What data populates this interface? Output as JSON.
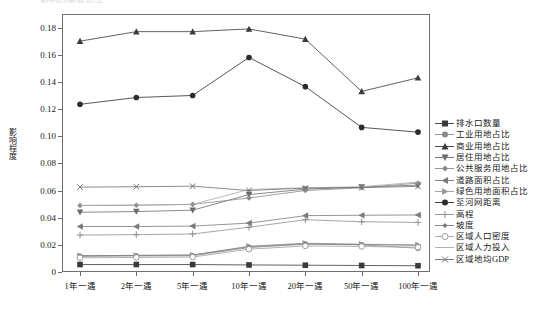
{
  "figure": {
    "partial_header_text": "影响因素敏感性",
    "y_axis_title": "影响程度"
  },
  "chart_data": {
    "type": "line",
    "title": "",
    "xlabel": "",
    "ylabel": "影响程度",
    "categories": [
      "1年一遇",
      "2年一遇",
      "5年一遇",
      "10年一遇",
      "20年一遇",
      "50年一遇",
      "100年一遇"
    ],
    "ylim": [
      0,
      0.19
    ],
    "yticks": [
      0,
      0.02,
      0.04,
      0.06,
      0.08,
      0.1,
      0.12,
      0.14,
      0.16,
      0.18
    ],
    "ytick_labels": [
      "0",
      "0.02",
      "0.04",
      "0.06",
      "0.08",
      "0.10",
      "0.12",
      "0.14",
      "0.16",
      "0.18"
    ],
    "grid": false,
    "legend_position": "right",
    "series": [
      {
        "name": "排水口数量",
        "marker": "square",
        "color": "#3a3a3a",
        "values": [
          0.0055,
          0.0055,
          0.0055,
          0.0052,
          0.005,
          0.0048,
          0.0046
        ]
      },
      {
        "name": "工业用地占比",
        "marker": "circle",
        "color": "#8a8a8a",
        "values": [
          0.0115,
          0.0118,
          0.012,
          0.018,
          0.0205,
          0.02,
          0.0175
        ]
      },
      {
        "name": "商业用地占比",
        "marker": "triangle-up",
        "color": "#3a3a3a",
        "values": [
          0.17,
          0.177,
          0.177,
          0.179,
          0.1715,
          0.133,
          0.143
        ]
      },
      {
        "name": "居住用地占比",
        "marker": "triangle-down",
        "color": "#6b6b6b",
        "values": [
          0.044,
          0.0445,
          0.0455,
          0.057,
          0.061,
          0.0625,
          0.064
        ]
      },
      {
        "name": "公共服务用地占比",
        "marker": "diamond",
        "color": "#8a8a8a",
        "values": [
          0.049,
          0.0492,
          0.0498,
          0.0545,
          0.06,
          0.062,
          0.0655
        ]
      },
      {
        "name": "道路面积占比",
        "marker": "triangle-left",
        "color": "#7a7a7a",
        "values": [
          0.0335,
          0.0335,
          0.0338,
          0.036,
          0.0415,
          0.0418,
          0.042
        ]
      },
      {
        "name": "绿色用地面积占比",
        "marker": "triangle-right",
        "color": "#9a9a9a",
        "values": [
          0.012,
          0.0122,
          0.0125,
          0.019,
          0.0212,
          0.0205,
          0.02
        ]
      },
      {
        "name": "至河网距离",
        "marker": "circle-filled",
        "color": "#2b2b2b",
        "values": [
          0.1235,
          0.1285,
          0.13,
          0.158,
          0.1365,
          0.1065,
          0.103
        ]
      },
      {
        "name": "高程",
        "marker": "plus",
        "color": "#8f8f8f",
        "values": [
          0.0272,
          0.0275,
          0.028,
          0.033,
          0.0385,
          0.037,
          0.0365
        ]
      },
      {
        "name": "坡度",
        "marker": "diamond-small",
        "color": "#7d7d7d",
        "values": [
          0.012,
          0.0122,
          0.0125,
          0.0186,
          0.0208,
          0.0202,
          0.0196
        ]
      },
      {
        "name": "区域人口密度",
        "marker": "circle-open",
        "color": "#9e9e9e",
        "values": [
          0.0105,
          0.0107,
          0.011,
          0.0168,
          0.0192,
          0.0188,
          0.0182
        ]
      },
      {
        "name": "区域人力投入",
        "marker": "line",
        "color": "#a8a8a8",
        "values": [
          0.049,
          0.0492,
          0.0498,
          0.0608,
          0.062,
          0.0628,
          0.0662
        ]
      },
      {
        "name": "区域地均GDP",
        "marker": "x",
        "color": "#707070",
        "values": [
          0.0625,
          0.0628,
          0.0632,
          0.06,
          0.0618,
          0.0622,
          0.063
        ]
      }
    ]
  }
}
